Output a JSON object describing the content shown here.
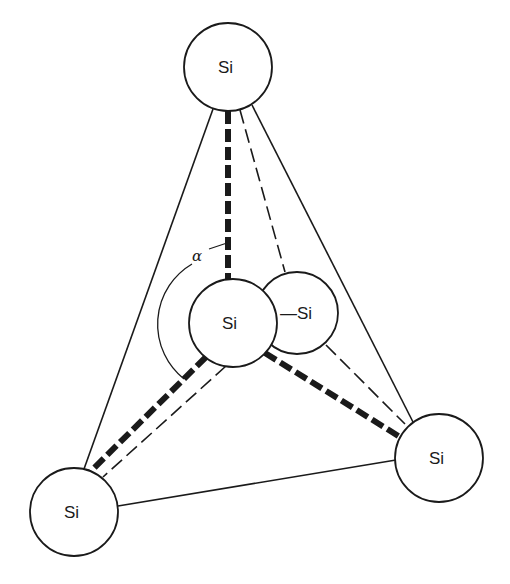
{
  "diagram": {
    "type": "tetrahedral silicon structure",
    "stroke_color": "#1a1a1a",
    "background": "#ffffff",
    "atoms": [
      {
        "id": "top",
        "label": "Si",
        "cx": 228,
        "cy": 67,
        "r": 44
      },
      {
        "id": "center",
        "label": "Si",
        "cx": 233,
        "cy": 323,
        "r": 44
      },
      {
        "id": "back",
        "label": "—Si",
        "cx": 297,
        "cy": 313,
        "r": 41
      },
      {
        "id": "bottom-left",
        "label": "Si",
        "cx": 74,
        "cy": 512,
        "r": 44
      },
      {
        "id": "bottom-right",
        "label": "Si",
        "cx": 439,
        "cy": 458,
        "r": 44
      }
    ],
    "angle_label": "α",
    "bonds": {
      "thick_dashed": [
        "center-top",
        "center-bottom-left",
        "center-bottom-right"
      ],
      "thin_dashed": [
        "back-top",
        "back-bottom-left",
        "back-bottom-right"
      ],
      "solid_edges": [
        "top-bottom-left",
        "top-bottom-right",
        "bottom-left-bottom-right"
      ]
    }
  }
}
